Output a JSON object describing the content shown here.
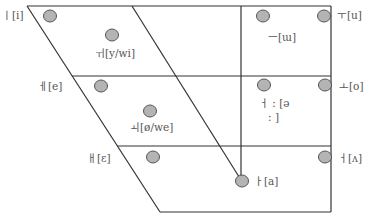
{
  "diagram": {
    "type": "korean-vowel-trapezoid",
    "colors": {
      "line": "#333333",
      "point_fill": "#b4b4b4",
      "point_stroke": "#555555",
      "label": "#555555"
    },
    "vowels": [
      {
        "id": "i",
        "label": "ㅣ[i]",
        "cx": 50,
        "cy": 16,
        "lx": 2,
        "ly": 9
      },
      {
        "id": "y-wi",
        "label": "ㅟ[y/wi]",
        "cx": 112,
        "cy": 35,
        "lx": 95,
        "ly": 47
      },
      {
        "id": "e",
        "label": "ㅔ[e]",
        "cx": 101,
        "cy": 86,
        "lx": 38,
        "ly": 80
      },
      {
        "id": "oe-we",
        "label": "ㅚ[ø/we]",
        "cx": 150,
        "cy": 111,
        "lx": 130,
        "ly": 121
      },
      {
        "id": "ae",
        "label": "ㅐ[ɛ]",
        "cx": 153,
        "cy": 157,
        "lx": 87,
        "ly": 152
      },
      {
        "id": "u",
        "label": "ㅜ[u]",
        "cx": 324,
        "cy": 16,
        "lx": 337,
        "ly": 9
      },
      {
        "id": "eu",
        "label": "ㅡ[ɯ]",
        "cx": 263,
        "cy": 16,
        "lx": 268,
        "ly": 31
      },
      {
        "id": "o",
        "label": "ㅗ[o]",
        "cx": 325,
        "cy": 85,
        "lx": 339,
        "ly": 80
      },
      {
        "id": "eo",
        "label": "ㅓ : [ə",
        "label2": ": ]",
        "cx": 264,
        "cy": 85,
        "lx": 259,
        "ly": 97,
        "lx2": 268,
        "ly2": 111
      },
      {
        "id": "eo-open",
        "label": "ㅓ[ʌ]",
        "cx": 325,
        "cy": 157,
        "lx": 338,
        "ly": 152
      },
      {
        "id": "a",
        "label": "ㅏ[a]",
        "cx": 242,
        "cy": 181,
        "lx": 254,
        "ly": 175
      }
    ]
  }
}
